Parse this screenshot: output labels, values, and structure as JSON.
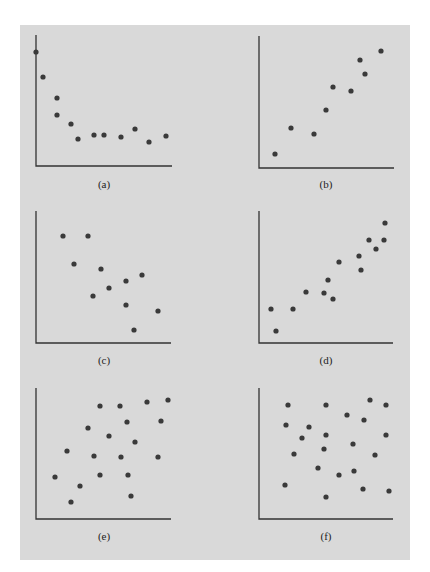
{
  "background_color": "#d9d9d9",
  "point_color": "#3a3a3a",
  "chart_data": [
    {
      "type": "scatter",
      "panel": "a",
      "caption": "(a)",
      "description": "Nonlinear decreasing relationship that levels off",
      "axes_px": {
        "x0": 36,
        "y0": 166,
        "x1": 172,
        "ytop": 35
      },
      "points_px": [
        [
          36,
          52
        ],
        [
          43,
          77
        ],
        [
          57,
          98
        ],
        [
          57,
          115
        ],
        [
          71,
          124
        ],
        [
          78,
          139
        ],
        [
          94,
          135
        ],
        [
          104,
          135
        ],
        [
          121,
          137
        ],
        [
          135,
          129
        ],
        [
          149,
          142
        ],
        [
          166,
          136
        ]
      ]
    },
    {
      "type": "scatter",
      "panel": "b",
      "caption": "(b)",
      "description": "Positive linear relationship",
      "axes_px": {
        "x0": 259,
        "y0": 168,
        "x1": 394,
        "ytop": 36
      },
      "points_px": [
        [
          275,
          154
        ],
        [
          291,
          128
        ],
        [
          314,
          134
        ],
        [
          326,
          110
        ],
        [
          333,
          87
        ],
        [
          351,
          91
        ],
        [
          360,
          60
        ],
        [
          365,
          74
        ],
        [
          381,
          51
        ]
      ]
    },
    {
      "type": "scatter",
      "panel": "c",
      "caption": "(c)",
      "description": "Negative linear relationship",
      "axes_px": {
        "x0": 36,
        "y0": 343,
        "x1": 171,
        "ytop": 211
      },
      "points_px": [
        [
          63,
          236
        ],
        [
          88,
          236
        ],
        [
          74,
          264
        ],
        [
          101,
          269
        ],
        [
          93,
          296
        ],
        [
          109,
          288
        ],
        [
          126,
          281
        ],
        [
          126,
          305
        ],
        [
          142,
          275
        ],
        [
          158,
          311
        ],
        [
          134,
          330
        ]
      ]
    },
    {
      "type": "scatter",
      "panel": "d",
      "caption": "(d)",
      "description": "Strong positive linear relationship",
      "axes_px": {
        "x0": 259,
        "y0": 343,
        "x1": 393,
        "ytop": 211
      },
      "points_px": [
        [
          271,
          309
        ],
        [
          276,
          331
        ],
        [
          293,
          309
        ],
        [
          306,
          292
        ],
        [
          324,
          293
        ],
        [
          328,
          280
        ],
        [
          333,
          299
        ],
        [
          339,
          262
        ],
        [
          359,
          256
        ],
        [
          361,
          270
        ],
        [
          369,
          240
        ],
        [
          376,
          249
        ],
        [
          384,
          240
        ],
        [
          385,
          223
        ]
      ]
    },
    {
      "type": "scatter",
      "panel": "e",
      "caption": "(e)",
      "description": "Weak positive relationship",
      "axes_px": {
        "x0": 36,
        "y0": 519,
        "x1": 171,
        "ytop": 388
      },
      "points_px": [
        [
          120,
          406
        ],
        [
          147,
          402
        ],
        [
          168,
          400
        ],
        [
          100,
          406
        ],
        [
          127,
          422
        ],
        [
          161,
          421
        ],
        [
          88,
          428
        ],
        [
          109,
          436
        ],
        [
          135,
          442
        ],
        [
          67,
          451
        ],
        [
          94,
          456
        ],
        [
          121,
          457
        ],
        [
          158,
          457
        ],
        [
          55,
          477
        ],
        [
          100,
          475
        ],
        [
          128,
          475
        ],
        [
          80,
          486
        ],
        [
          131,
          496
        ],
        [
          71,
          502
        ]
      ]
    },
    {
      "type": "scatter",
      "panel": "f",
      "caption": "(f)",
      "description": "No relationship",
      "axes_px": {
        "x0": 259,
        "y0": 519,
        "x1": 393,
        "ytop": 388
      },
      "points_px": [
        [
          288,
          405
        ],
        [
          326,
          405
        ],
        [
          370,
          400
        ],
        [
          386,
          405
        ],
        [
          347,
          415
        ],
        [
          364,
          420
        ],
        [
          286,
          425
        ],
        [
          309,
          427
        ],
        [
          326,
          435
        ],
        [
          302,
          438
        ],
        [
          386,
          435
        ],
        [
          353,
          444
        ],
        [
          294,
          454
        ],
        [
          324,
          449
        ],
        [
          375,
          455
        ],
        [
          318,
          468
        ],
        [
          339,
          475
        ],
        [
          354,
          471
        ],
        [
          285,
          485
        ],
        [
          363,
          489
        ],
        [
          389,
          491
        ],
        [
          326,
          497
        ]
      ]
    }
  ],
  "captions": {
    "a": "(a)",
    "b": "(b)",
    "c": "(c)",
    "d": "(d)",
    "e": "(e)",
    "f": "(f)"
  }
}
